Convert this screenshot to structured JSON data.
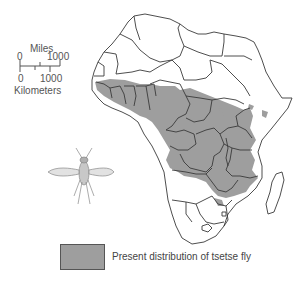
{
  "map": {
    "region": "Africa",
    "colors": {
      "background": "#ffffff",
      "land": "#ffffff",
      "border": "#3a3a3a",
      "tsetse_area": "#9e9e9e"
    }
  },
  "scale_bar": {
    "miles_label": "Miles",
    "miles_start": "0",
    "miles_end": "1000",
    "km_start": "0",
    "km_end": "1000",
    "km_label": "Kilometers"
  },
  "illustration": {
    "subject": "tsetse-fly-icon"
  },
  "legend": {
    "items": [
      {
        "label": "Present distribution of tsetse fly",
        "color": "#9e9e9e"
      }
    ]
  }
}
